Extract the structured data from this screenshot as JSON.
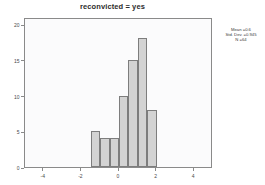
{
  "chart_data": {
    "type": "bar",
    "title": "reconvicted = yes",
    "subtitle": "",
    "xlabel": "",
    "ylabel": "",
    "xlim": [
      -5,
      5
    ],
    "ylim": [
      0,
      21
    ],
    "grid": false,
    "legend": null,
    "bin_width": 0.5,
    "bin_left_edges": [
      -1.5,
      -1.0,
      -0.5,
      0.0,
      0.5,
      1.0,
      1.5
    ],
    "bin_centers": [
      -1.25,
      -0.75,
      -0.25,
      0.25,
      0.75,
      1.25,
      1.75
    ],
    "categories": [
      "-1.5",
      "-1.0",
      "-0.5",
      "0.0",
      "0.5",
      "1.0",
      "1.5"
    ],
    "values": [
      5,
      4,
      4,
      10,
      15,
      18,
      8
    ],
    "xticks": [
      {
        "value": -4,
        "label": "-4"
      },
      {
        "value": -2,
        "label": "-2"
      },
      {
        "value": 0,
        "label": "0"
      },
      {
        "value": 2,
        "label": "2"
      },
      {
        "value": 4,
        "label": "4"
      }
    ],
    "yticks": [
      {
        "value": 0,
        "label": "0"
      },
      {
        "value": 5,
        "label": "5"
      },
      {
        "value": 10,
        "label": "10"
      },
      {
        "value": 15,
        "label": "15"
      },
      {
        "value": 20,
        "label": "20"
      }
    ],
    "annotations": {
      "mean": "Mean =0.6",
      "std_dev": "Std. Dev. =0.945",
      "n": "N =64"
    },
    "colors": {
      "bar_fill": "#d3d3d3",
      "bar_border": "#7d7d7d",
      "plot_background": "#fbfbfc",
      "frame": "#8a8a8a",
      "text": "#4a4a4a",
      "title_text": "#2b2b2b",
      "page_background": "#ffffff"
    }
  }
}
